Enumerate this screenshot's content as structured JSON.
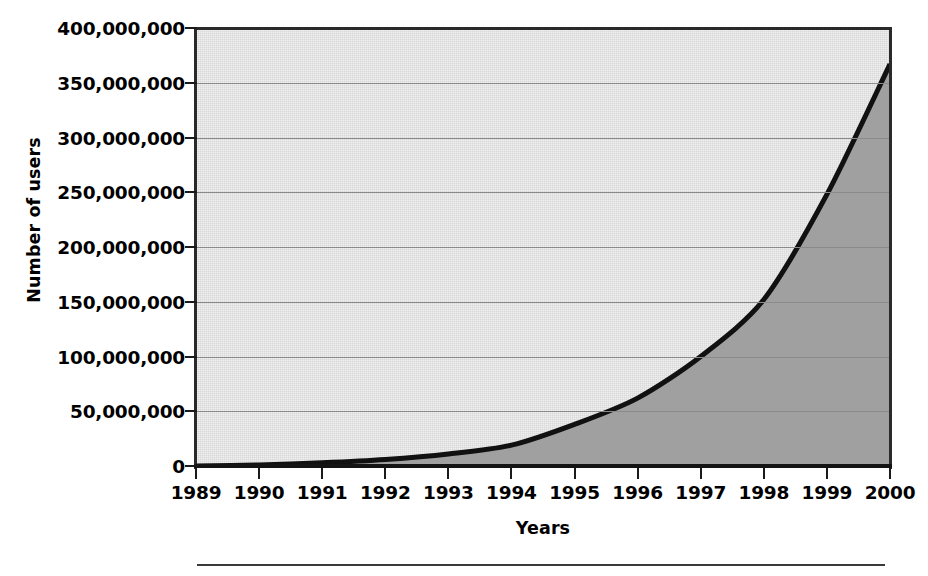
{
  "chart_data": {
    "type": "area",
    "title": "",
    "xlabel": "Years",
    "ylabel": "Number of users",
    "categories": [
      "1989",
      "1990",
      "1991",
      "1992",
      "1993",
      "1994",
      "1995",
      "1996",
      "1997",
      "1998",
      "1999",
      "2000"
    ],
    "values": [
      0,
      1000000,
      3000000,
      6000000,
      11000000,
      19000000,
      38000000,
      62000000,
      100000000,
      152000000,
      248000000,
      367000000
    ],
    "series": [
      {
        "name": "Number of users",
        "values": [
          0,
          1000000,
          3000000,
          6000000,
          11000000,
          19000000,
          38000000,
          62000000,
          100000000,
          152000000,
          248000000,
          367000000
        ]
      }
    ],
    "xlim": [
      1989,
      2000
    ],
    "ylim": [
      0,
      400000000
    ],
    "ytick_values": [
      0,
      50000000,
      100000000,
      150000000,
      200000000,
      250000000,
      300000000,
      350000000,
      400000000
    ],
    "ytick_labels": [
      "0",
      "50,000,000",
      "100,000,000",
      "150,000,000",
      "200,000,000",
      "250,000,000",
      "300,000,000",
      "350,000,000",
      "400,000,000"
    ],
    "xtick_labels": [
      "1989",
      "1990",
      "1991",
      "1992",
      "1993",
      "1994",
      "1995",
      "1996",
      "1997",
      "1998",
      "1999",
      "2000"
    ],
    "grid": "horizontal",
    "legend": "none",
    "colors": {
      "plot_background": "#efefef",
      "area_fill": "#a0a0a0",
      "line": "#111111",
      "gridline": "#8a8a8a",
      "axis": "#1a1a1a",
      "text": "#000000",
      "page_background": "#ffffff",
      "bottom_rule": "#3a3a3a"
    }
  },
  "axes": {
    "y_title": "Number of users",
    "x_title": "Years"
  }
}
